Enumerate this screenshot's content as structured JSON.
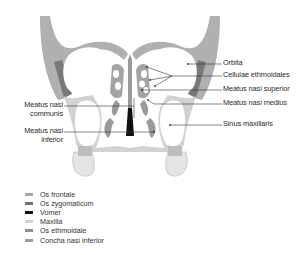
{
  "diagram": {
    "type": "anatomical-coronal-section",
    "labels_right": [
      {
        "id": "orbita",
        "text": "Orbita"
      },
      {
        "id": "cellulae-ethmoidales",
        "text": "Cellulae ethmoidales"
      },
      {
        "id": "meatus-nasi-superior",
        "text": "Meatus nasi superior"
      },
      {
        "id": "meatus-nasi-medius",
        "text": "Meatus nasi medius"
      },
      {
        "id": "sinus-maxillaris",
        "text": "Sinus maxillaris"
      }
    ],
    "labels_left": [
      {
        "id": "meatus-nasi-communis",
        "line1": "Meatus nasi",
        "line2": "communis"
      },
      {
        "id": "meatus-nasi-inferior",
        "line1": "Meatus nasi",
        "line2": "inferior"
      }
    ]
  },
  "legend": {
    "items": [
      {
        "label": "Os frontale",
        "color": "#a9a9a9"
      },
      {
        "label": "Os zygomaticum",
        "color": "#6f6f6f"
      },
      {
        "label": "Vomer",
        "color": "#111111"
      },
      {
        "label": "Maxilla",
        "color": "#cfcfcf"
      },
      {
        "label": "Os ethmoidale",
        "color": "#8e8e8e"
      },
      {
        "label": "Concha nasi inferior",
        "color": "#9a9a9a"
      }
    ]
  },
  "colors": {
    "frontal": "#a9a9a9",
    "zygomatic": "#6f6f6f",
    "vomer": "#111111",
    "maxilla": "#cfcfcf",
    "ethmoid": "#8e8e8e",
    "concha": "#9a9a9a",
    "line": "#333333",
    "background": "#ffffff"
  }
}
